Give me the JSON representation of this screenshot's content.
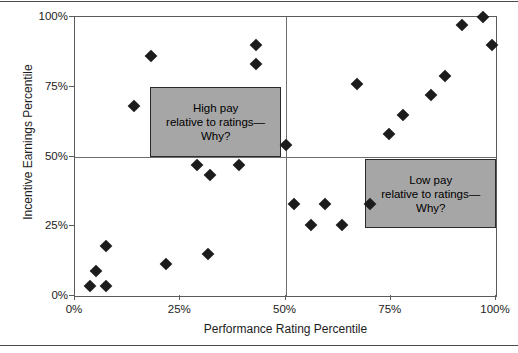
{
  "chart_data": {
    "type": "scatter",
    "title": "",
    "xlabel": "Performance Rating Percentile",
    "ylabel": "Incentive Earnings Percentile",
    "xlim": [
      0,
      100
    ],
    "ylim": [
      0,
      100
    ],
    "xticks": [
      "0%",
      "25%",
      "50%",
      "75%",
      "100%"
    ],
    "xtick_values": [
      0,
      25,
      50,
      75,
      100
    ],
    "yticks": [
      "0%",
      "25%",
      "50%",
      "75%",
      "100%"
    ],
    "ytick_values": [
      0,
      25,
      50,
      75,
      100
    ],
    "grid": false,
    "legend": "none",
    "marker": "diamond",
    "marker_color": "#1c1c1c",
    "reference_lines": [
      {
        "axis": "x",
        "value": 50
      },
      {
        "axis": "y",
        "value": 50
      }
    ],
    "points": [
      {
        "x": 3.6,
        "y": 3.5
      },
      {
        "x": 7.3,
        "y": 3.5
      },
      {
        "x": 5.0,
        "y": 9.0
      },
      {
        "x": 7.3,
        "y": 18.0
      },
      {
        "x": 14.0,
        "y": 68.0
      },
      {
        "x": 18.0,
        "y": 86.0
      },
      {
        "x": 21.5,
        "y": 11.5
      },
      {
        "x": 29.0,
        "y": 47.0
      },
      {
        "x": 31.5,
        "y": 15.0
      },
      {
        "x": 32.0,
        "y": 43.5
      },
      {
        "x": 39.0,
        "y": 47.0
      },
      {
        "x": 43.0,
        "y": 90.0
      },
      {
        "x": 43.0,
        "y": 83.0
      },
      {
        "x": 50.0,
        "y": 54.0
      },
      {
        "x": 52.0,
        "y": 33.0
      },
      {
        "x": 56.0,
        "y": 25.5
      },
      {
        "x": 59.5,
        "y": 33.0
      },
      {
        "x": 63.5,
        "y": 25.5
      },
      {
        "x": 67.0,
        "y": 76.0
      },
      {
        "x": 70.0,
        "y": 33.0
      },
      {
        "x": 74.5,
        "y": 58.0
      },
      {
        "x": 78.0,
        "y": 65.0
      },
      {
        "x": 84.5,
        "y": 72.0
      },
      {
        "x": 88.0,
        "y": 79.0
      },
      {
        "x": 92.0,
        "y": 97.0
      },
      {
        "x": 97.0,
        "y": 100.0
      },
      {
        "x": 99.0,
        "y": 90.0
      }
    ],
    "annotations": [
      {
        "id": "high-pay",
        "lines": [
          "High pay",
          "relative to ratings—",
          "Why?"
        ],
        "box_x": 17.9,
        "box_y": 50.0,
        "box_w": 31.0,
        "box_h": 25.0,
        "fill": "#a6a6a6",
        "border": "#2b2b2b"
      },
      {
        "id": "low-pay",
        "lines": [
          "Low pay",
          "relative to ratings—",
          "Why?"
        ],
        "box_x": 69.0,
        "box_y": 24.2,
        "box_w": 31.0,
        "box_h": 25.0,
        "fill": "#a6a6a6",
        "border": "#2b2b2b"
      }
    ]
  }
}
